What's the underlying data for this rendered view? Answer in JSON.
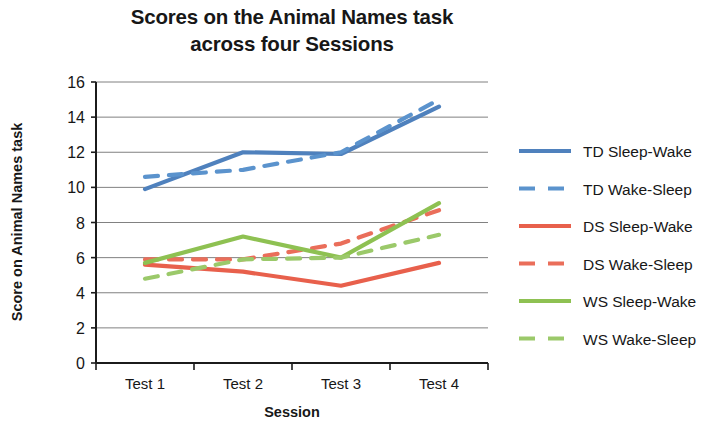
{
  "chart_data": {
    "type": "line",
    "title": "Scores on the Animal Names task across four Sessions",
    "title_line_1": "Scores on the Animal Names task",
    "title_line_2": "across four Sessions",
    "xlabel": "Session",
    "ylabel": "Score on Animal Names task",
    "categories": [
      "Test 1",
      "Test 2",
      "Test 3",
      "Test 4"
    ],
    "ylim": [
      0,
      16
    ],
    "ytick_step": 2,
    "yticks": [
      "0",
      "2",
      "4",
      "6",
      "8",
      "10",
      "12",
      "14",
      "16"
    ],
    "grid": true,
    "grid_axis": "y",
    "legend_position": "right",
    "series": [
      {
        "name": "TD Sleep-Wake",
        "color": "#4f81bd",
        "dash": "solid",
        "values": [
          9.9,
          12.0,
          11.9,
          14.6
        ]
      },
      {
        "name": "TD Wake-Sleep",
        "color": "#5b93cd",
        "dash": "dashed",
        "values": [
          10.6,
          11.0,
          12.0,
          15.0
        ]
      },
      {
        "name": "DS Sleep-Wake",
        "color": "#e8604c",
        "dash": "solid",
        "values": [
          5.6,
          5.2,
          4.4,
          5.7
        ]
      },
      {
        "name": "DS Wake-Sleep",
        "color": "#ea6e5a",
        "dash": "dashed",
        "values": [
          5.9,
          5.9,
          6.8,
          8.7
        ]
      },
      {
        "name": "WS Sleep-Wake",
        "color": "#8ec152",
        "dash": "solid",
        "values": [
          5.7,
          7.2,
          6.0,
          9.1
        ]
      },
      {
        "name": "WS Wake-Sleep",
        "color": "#9bc96a",
        "dash": "dashed",
        "values": [
          4.8,
          5.9,
          6.0,
          7.3
        ]
      }
    ]
  },
  "colors": {
    "td_blue": "#4f81bd",
    "ds_red": "#e8604c",
    "ws_green": "#8ec152",
    "gridline": "#5b5b5b",
    "axis": "#1b1b1b",
    "text": "#171717",
    "background": "#ffffff"
  }
}
